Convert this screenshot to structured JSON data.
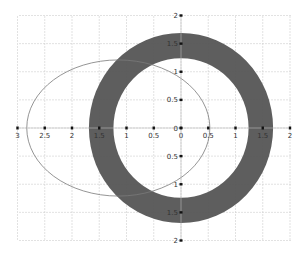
{
  "chart_data": {
    "type": "scatter",
    "title": "",
    "xlabel": "",
    "ylabel": "",
    "xlim": [
      -3,
      2
    ],
    "ylim": [
      -2,
      2
    ],
    "grid": true,
    "x_tick_labels": [
      "3",
      "2.5",
      "2",
      "1.5",
      "1",
      "0.5",
      "0",
      "0.5",
      "1",
      "1.5",
      "2"
    ],
    "x_tick_values": [
      -3,
      -2.5,
      -2,
      -1.5,
      -1,
      -0.5,
      0,
      0.5,
      1,
      1.5,
      2
    ],
    "y_tick_labels": [
      "2",
      "1.5",
      "1",
      "0.5",
      "0",
      "0.5",
      "1",
      "1.5",
      "2"
    ],
    "y_tick_values": [
      2,
      1.5,
      1,
      0.5,
      0,
      -0.5,
      -1,
      -1.5,
      -2
    ],
    "shapes": [
      {
        "name": "ellipse",
        "kind": "ellipse-outline",
        "center": [
          -1.15,
          0
        ],
        "rx": 1.68,
        "ry": 1.21,
        "stroke": "#777777",
        "fill": "none"
      },
      {
        "name": "ring",
        "kind": "annulus",
        "center": [
          0,
          0
        ],
        "outer_radius": 1.69,
        "inner_radius": 1.24,
        "fill": "#555555"
      }
    ]
  },
  "colors": {
    "ring": "#555555",
    "ellipse_stroke": "#7a7a7a",
    "grid": "#cfcfcf",
    "tick": "#111111",
    "label": "#333333"
  },
  "plot": {
    "left": 19,
    "right": 291,
    "top": 16,
    "bottom": 241,
    "origin_x": 181,
    "origin_y": 128,
    "px_per_unit_x": 54.5,
    "px_per_unit_y": 56.25
  }
}
